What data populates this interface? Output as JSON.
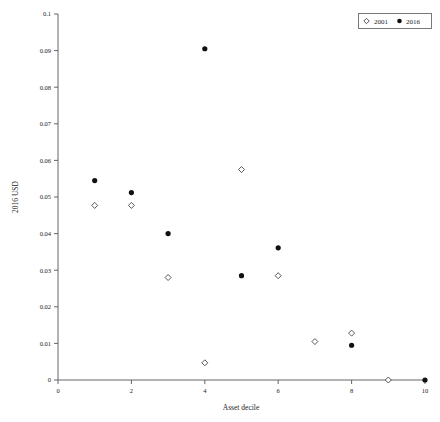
{
  "chart_data": {
    "type": "scatter",
    "title": "",
    "xlabel": "Asset decile",
    "ylabel": "2016 USD",
    "xlim": [
      0,
      10
    ],
    "ylim": [
      0,
      0.1
    ],
    "grid": false,
    "legend_position": "top-right",
    "x_ticks": [
      "0",
      "2",
      "4",
      "6",
      "8",
      "10"
    ],
    "x_tick_values": [
      0,
      2,
      4,
      6,
      8,
      10
    ],
    "y_ticks": [
      "0",
      "0.01",
      "0.02",
      "0.03",
      "0.04",
      "0.05",
      "0.06",
      "0.07",
      "0.08",
      "0.09",
      "0.1"
    ],
    "y_tick_values": [
      0,
      0.01,
      0.02,
      0.03,
      0.04,
      0.05,
      0.06,
      0.07,
      0.08,
      0.09,
      0.1
    ],
    "categories": [
      1,
      2,
      3,
      4,
      5,
      6,
      7,
      8,
      9,
      10
    ],
    "series": [
      {
        "name": "2001",
        "marker": "open-diamond",
        "color": "#ffffff",
        "edge_color": "#3a3a3a",
        "x": [
          1,
          2,
          3,
          4,
          5,
          6,
          7,
          8,
          9
        ],
        "values": [
          0.0477,
          0.0477,
          0.028,
          0.0047,
          0.0575,
          0.0285,
          0.0105,
          0.0128,
          0.0
        ]
      },
      {
        "name": "2016",
        "marker": "filled-circle",
        "color": "#111111",
        "edge_color": "#111111",
        "x": [
          1,
          2,
          3,
          4,
          5,
          6,
          8,
          10
        ],
        "values": [
          0.0545,
          0.0512,
          0.04,
          0.0905,
          0.0285,
          0.0361,
          0.0095,
          0.0
        ]
      }
    ]
  },
  "legend": {
    "entries": [
      {
        "marker": "open-diamond",
        "label": "2001"
      },
      {
        "marker": "filled-circle",
        "label": "2016"
      }
    ]
  }
}
